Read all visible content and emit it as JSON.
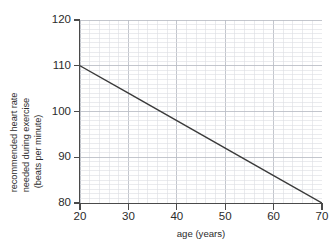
{
  "chart_data": {
    "type": "line",
    "title": "",
    "xlabel": "age (years)",
    "ylabel": "recommended heart rate needed during exercise (beats per minute)",
    "ylabel_lines": [
      "recommended heart rate",
      "needed during exercise",
      "(beats per minute)"
    ],
    "xlim": [
      20,
      70
    ],
    "ylim": [
      80,
      120
    ],
    "x_major_step": 10,
    "y_major_step": 10,
    "x_minor_step": 2,
    "y_minor_step": 1,
    "grid": true,
    "legend": "none",
    "xticks": [
      20,
      30,
      40,
      50,
      60,
      70
    ],
    "xtick_labels": [
      "20",
      "30",
      "40",
      "50",
      "60",
      "70"
    ],
    "yticks": [
      80,
      90,
      100,
      110,
      120
    ],
    "ytick_labels": [
      "80",
      "90",
      "100",
      "110",
      "120"
    ],
    "series": [
      {
        "name": "recommended heart rate",
        "x": [
          20,
          30,
          40,
          50,
          60,
          70
        ],
        "values": [
          110,
          104,
          98,
          92,
          86,
          80
        ],
        "color": "#3a3a3a",
        "line_width": 1.4,
        "endpoints": [
          [
            20,
            110
          ],
          [
            70,
            80
          ]
        ],
        "slope_per_year": -0.6,
        "intercept_at_age_0": 122
      }
    ],
    "colors": {
      "background": "#ffffff",
      "axis": "#4a4a4a",
      "major_grid": "#b9bcc4",
      "minor_grid": "#dcdee3",
      "text": "#2b2b2b",
      "data_line": "#3a3a3a"
    }
  },
  "axes": {
    "x_title": "age (years)",
    "y_title_line1": "recommended heart rate",
    "y_title_line2": "needed during exercise",
    "y_title_line3": "(beats per minute)"
  },
  "ticks": {
    "x": [
      {
        "value": 20,
        "label": "20"
      },
      {
        "value": 30,
        "label": "30"
      },
      {
        "value": 40,
        "label": "40"
      },
      {
        "value": 50,
        "label": "50"
      },
      {
        "value": 60,
        "label": "60"
      },
      {
        "value": 70,
        "label": "70"
      }
    ],
    "y": [
      {
        "value": 120,
        "label": "120"
      },
      {
        "value": 110,
        "label": "110"
      },
      {
        "value": 100,
        "label": "100"
      },
      {
        "value": 90,
        "label": "90"
      },
      {
        "value": 80,
        "label": "80"
      }
    ]
  }
}
